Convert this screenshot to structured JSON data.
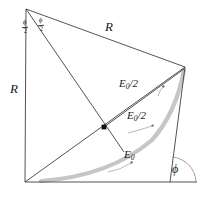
{
  "figure": {
    "background_color": "#ffffff",
    "line_color": "#3f3f3f",
    "arc_color": "#c6c6c6",
    "leader_color": "#9a9a9a",
    "marker_color": "#111111",
    "width": 205,
    "height": 197
  },
  "labels": {
    "radius_left": "R",
    "radius_top": "R",
    "amplitude_half_upper": {
      "base": "E",
      "subscript": "0",
      "suffix": "/2"
    },
    "amplitude_half_lower": {
      "base": "E",
      "subscript": "0",
      "suffix": "/2"
    },
    "amplitude_full": {
      "base": "E",
      "subscript": "0",
      "suffix": ""
    },
    "angle_phi": "ϕ",
    "half_angle_left": {
      "numerator": "ϕ",
      "denominator": "2"
    },
    "half_angle_right": {
      "numerator": "ϕ",
      "denominator": "2"
    }
  },
  "geometry": {
    "apex_top": [
      26,
      9
    ],
    "origin_bottom_left": [
      25,
      182
    ],
    "vertex_right": [
      185,
      67
    ],
    "baseline_end": [
      197,
      182
    ],
    "chord_foot": [
      170,
      182
    ],
    "midpoint_marker": [
      104,
      127
    ],
    "arc_start": [
      42,
      180
    ],
    "arc_end": [
      184,
      70
    ]
  }
}
